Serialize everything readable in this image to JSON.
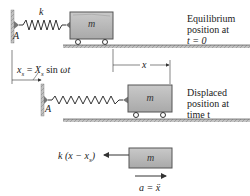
{
  "figure": {
    "top_panel": {
      "spring_label": "k",
      "anchor_label": "A",
      "mass_label": "m",
      "caption_lines": [
        "Equilibrium",
        "position at",
        "t = 0"
      ]
    },
    "support_motion": {
      "equation": "x_s = X_s sin ωt",
      "equation_parts": {
        "lhs": "x",
        "lhs_sub": "s",
        "eq": " = ",
        "amp": "X",
        "amp_sub": "s",
        "fn": " sin ",
        "freq": "ω",
        "t": "t"
      }
    },
    "displacement_label": "x",
    "middle_panel": {
      "anchor_label": "A",
      "mass_label": "m",
      "caption_lines": [
        "Displaced",
        "position at",
        "time t"
      ]
    },
    "free_body": {
      "mass_label": "m",
      "force_label": "k (x − x",
      "force_label_sub": "s",
      "force_label_close": ")",
      "accel_label": "a = ẍ"
    },
    "colors": {
      "block_fill": "#b8b8b8",
      "block_border": "#555555",
      "floor_fill": "#bdbdbd",
      "wall_fill": "#a9a9a9",
      "line": "#333333"
    }
  }
}
